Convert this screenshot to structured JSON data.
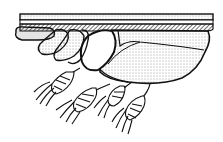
{
  "illustration": {
    "description": "Black and white stippled line drawing of a hand gripping a horizontal bar with a stippled pouch-like body and four hanging grain ears",
    "colors": {
      "ink": "#111111",
      "paper": "#ffffff",
      "stipple": "#333333"
    },
    "parts": {
      "bar": "horizontal-bar",
      "hand": "gripping-hand",
      "body": "stippled-body",
      "grain_ears": [
        "grain-ear-1",
        "grain-ear-2",
        "grain-ear-3",
        "grain-ear-4"
      ]
    }
  }
}
